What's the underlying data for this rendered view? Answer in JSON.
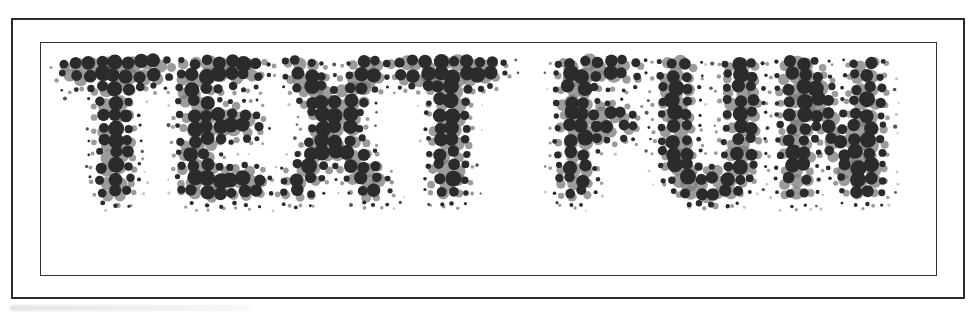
{
  "artwork": {
    "words": [
      {
        "text": "TEXT",
        "x": 62,
        "width": 440
      },
      {
        "text": "FUN",
        "x": 548,
        "width": 346
      }
    ],
    "full_text": "TEXT FUN",
    "style": "halftone-dots",
    "baseline_top": 82,
    "cap_height": 148,
    "colors": {
      "dot_dark": "#2b2b2b",
      "dot_mid": "#7a7a7a",
      "dot_light": "#c8c8c8",
      "frame": "#2a2a2a",
      "background": "#ffffff"
    }
  }
}
